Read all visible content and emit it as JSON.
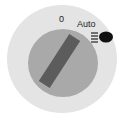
{
  "light_switch": {
    "positions": [
      {
        "label": "0"
      },
      {
        "label": "Auto"
      }
    ],
    "icon": "headlight-icon",
    "colors": {
      "outer_ring": "#e4e4e4",
      "knob": "#a9a9a9",
      "handle": "#5c5c5c"
    }
  }
}
